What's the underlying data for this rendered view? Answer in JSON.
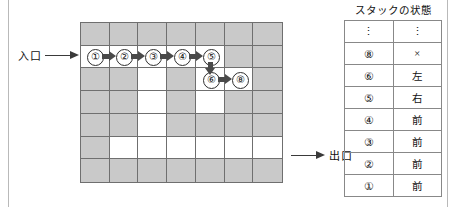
{
  "diagram": {
    "entrance": {
      "label": "入口",
      "arrow_icon": "arrow-right-icon"
    },
    "exit": {
      "label": "出口",
      "arrow_icon": "arrow-right-icon"
    }
  },
  "maze": {
    "rows": 7,
    "cols": 7,
    "wall_color": "#c9c9c9",
    "open_color": "#ffffff",
    "border_color": "#6f6f6f",
    "grid": [
      [
        "wall",
        "wall",
        "wall",
        "wall",
        "wall",
        "wall",
        "wall"
      ],
      [
        "open",
        "open",
        "open",
        "open",
        "open",
        "wall",
        "wall"
      ],
      [
        "wall",
        "wall",
        "open",
        "wall",
        "open",
        "open",
        "wall"
      ],
      [
        "wall",
        "wall",
        "open",
        "wall",
        "open",
        "wall",
        "wall"
      ],
      [
        "wall",
        "wall",
        "open",
        "wall",
        "wall",
        "wall",
        "wall"
      ],
      [
        "wall",
        "open",
        "open",
        "open",
        "open",
        "open",
        "open"
      ],
      [
        "wall",
        "wall",
        "wall",
        "wall",
        "wall",
        "wall",
        "wall"
      ]
    ]
  },
  "path": {
    "steps": [
      {
        "label": "①",
        "row": 2,
        "col": 1
      },
      {
        "label": "②",
        "row": 2,
        "col": 2
      },
      {
        "label": "③",
        "row": 2,
        "col": 3
      },
      {
        "label": "④",
        "row": 2,
        "col": 4
      },
      {
        "label": "⑤",
        "row": 2,
        "col": 5
      },
      {
        "label": "⑥",
        "row": 3,
        "col": 5
      },
      {
        "label": "⑧",
        "row": 3,
        "col": 6
      }
    ],
    "arrows": [
      {
        "dir": "right",
        "from": "①",
        "to": "②"
      },
      {
        "dir": "right",
        "from": "②",
        "to": "③"
      },
      {
        "dir": "right",
        "from": "③",
        "to": "④"
      },
      {
        "dir": "right",
        "from": "④",
        "to": "⑤"
      },
      {
        "dir": "down",
        "from": "⑤",
        "to": "⑥"
      },
      {
        "dir": "right",
        "from": "⑥",
        "to": "⑧"
      }
    ]
  },
  "stack": {
    "title": "スタックの状態",
    "rows": [
      {
        "id": "⋮",
        "value": "⋮"
      },
      {
        "id": "⑧",
        "value": "×"
      },
      {
        "id": "⑥",
        "value": "左"
      },
      {
        "id": "⑤",
        "value": "右"
      },
      {
        "id": "④",
        "value": "前"
      },
      {
        "id": "③",
        "value": "前"
      },
      {
        "id": "②",
        "value": "前"
      },
      {
        "id": "①",
        "value": "前"
      }
    ]
  }
}
